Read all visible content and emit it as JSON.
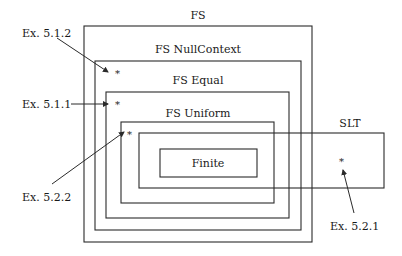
{
  "diagram": {
    "sets": [
      {
        "id": "fs",
        "label": "FS"
      },
      {
        "id": "nullcontext",
        "label": "FS NullContext"
      },
      {
        "id": "equal",
        "label": "FS Equal"
      },
      {
        "id": "uniform",
        "label": "FS Uniform"
      },
      {
        "id": "slt",
        "label": "SLT"
      },
      {
        "id": "finite",
        "label": "Finite"
      }
    ],
    "examples": [
      {
        "id": "ex512",
        "label": "Ex. 5.1.2",
        "region": "FS minus FS Equal (in NullContext)"
      },
      {
        "id": "ex511",
        "label": "Ex. 5.1.1",
        "region": "FS Equal minus FS Uniform"
      },
      {
        "id": "ex522",
        "label": "Ex. 5.2.2",
        "region": "FS Uniform minus SLT"
      },
      {
        "id": "ex521",
        "label": "Ex. 5.2.1",
        "region": "SLT minus FS"
      }
    ],
    "marker": "*"
  }
}
